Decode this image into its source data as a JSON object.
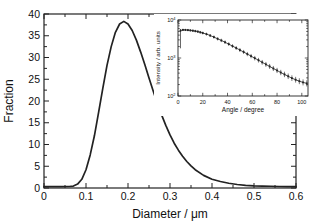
{
  "figure": {
    "background": "#ffffff",
    "line_color": "#222222",
    "text_color": "#111111"
  },
  "chart_data": [
    {
      "type": "line",
      "role": "main",
      "title": "",
      "xlabel": "Diameter / μm",
      "ylabel": "Fraction",
      "xlim": [
        0,
        0.6
      ],
      "ylim": [
        0,
        40
      ],
      "x_ticks": [
        0,
        0.1,
        0.2,
        0.3,
        0.4,
        0.5,
        0.6
      ],
      "x_tick_labels": [
        "0",
        "0.1",
        "0.2",
        "0.3",
        "0.4",
        "0.5",
        "0.6"
      ],
      "x_minor_step": 0.05,
      "y_ticks": [
        0,
        5,
        10,
        15,
        20,
        25,
        30,
        35,
        40
      ],
      "y_tick_labels": [
        "0",
        "5",
        "10",
        "15",
        "20",
        "25",
        "30",
        "35",
        "40"
      ],
      "y_minor_step": 2.5,
      "grid": false,
      "series": [
        {
          "name": "size-distribution",
          "x": [
            0,
            0.02,
            0.04,
            0.06,
            0.07,
            0.08,
            0.09,
            0.1,
            0.11,
            0.12,
            0.13,
            0.14,
            0.15,
            0.16,
            0.17,
            0.18,
            0.19,
            0.2,
            0.21,
            0.22,
            0.23,
            0.24,
            0.25,
            0.26,
            0.27,
            0.28,
            0.29,
            0.3,
            0.31,
            0.32,
            0.33,
            0.34,
            0.35,
            0.36,
            0.38,
            0.4,
            0.42,
            0.44,
            0.46,
            0.48,
            0.5,
            0.52,
            0.54,
            0.56,
            0.58,
            0.6
          ],
          "y": [
            0.3,
            0.3,
            0.3,
            0.35,
            0.45,
            0.9,
            2.0,
            4.2,
            7.6,
            12.0,
            17.4,
            22.9,
            28.2,
            32.5,
            35.8,
            37.7,
            38.3,
            37.7,
            36.2,
            34.0,
            31.3,
            28.4,
            25.3,
            22.3,
            19.4,
            16.8,
            14.4,
            12.2,
            10.3,
            8.7,
            7.3,
            6.1,
            5.1,
            4.2,
            2.9,
            2.0,
            1.5,
            1.1,
            0.8,
            0.6,
            0.5,
            0.45,
            0.4,
            0.35,
            0.33,
            0.3
          ]
        }
      ]
    },
    {
      "type": "scatter",
      "role": "inset",
      "title": "",
      "xlabel": "Angle / degree",
      "ylabel": "Intensity / arb. units",
      "xlim": [
        0,
        105
      ],
      "x_ticks": [
        0,
        20,
        40,
        60,
        80,
        100
      ],
      "x_tick_labels": [
        "0",
        "20",
        "40",
        "60",
        "80",
        "100"
      ],
      "x_minor_step": 10,
      "y_scale": "log",
      "y_decades": [
        100,
        1000,
        10000
      ],
      "y_tick_labels": [
        "10²",
        "10³",
        "10⁴"
      ],
      "grid": false,
      "series": [
        {
          "name": "scattering-intensity",
          "points": [
            [
              2,
              5250
            ],
            [
              4,
              5500
            ],
            [
              6,
              5480
            ],
            [
              8,
              5420
            ],
            [
              10,
              5330
            ],
            [
              12,
              5230
            ],
            [
              14,
              5100
            ],
            [
              16,
              4950
            ],
            [
              18,
              4750
            ],
            [
              20,
              4550
            ],
            [
              23,
              4250
            ],
            [
              26,
              3900
            ],
            [
              29,
              3550
            ],
            [
              32,
              3200
            ],
            [
              35,
              2900
            ],
            [
              38,
              2600
            ],
            [
              41,
              2320
            ],
            [
              44,
              2060
            ],
            [
              47,
              1830
            ],
            [
              50,
              1620
            ],
            [
              53,
              1440
            ],
            [
              56,
              1270
            ],
            [
              59,
              1120
            ],
            [
              62,
              990
            ],
            [
              65,
              875
            ],
            [
              68,
              770
            ],
            [
              71,
              680
            ],
            [
              74,
              600
            ],
            [
              77,
              530
            ],
            [
              80,
              470
            ],
            [
              83,
              415
            ],
            [
              86,
              370
            ],
            [
              89,
              330
            ],
            [
              92,
              295
            ],
            [
              95,
              268
            ],
            [
              98,
              245
            ],
            [
              101,
              228
            ],
            [
              104,
              215
            ]
          ],
          "outlier_error_bar": {
            "angle": 2,
            "from": 5800,
            "to": 1800
          }
        }
      ]
    }
  ]
}
